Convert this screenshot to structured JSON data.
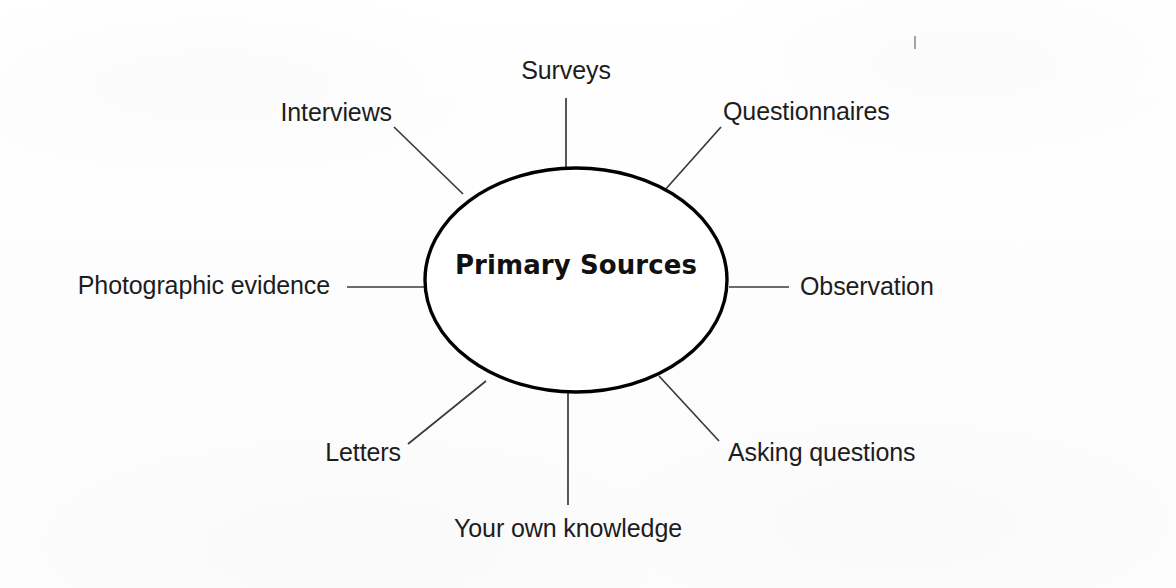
{
  "diagram": {
    "kind": "spider-diagram",
    "center_node": {
      "label": "Primary Sources",
      "shape": "ellipse",
      "cx": 576,
      "cy": 280,
      "rx": 151,
      "ry": 112,
      "stroke_color": "#000000",
      "stroke_width": 3.4,
      "fill_color": "#ffffff"
    },
    "spoke_color": "#3a3a3a",
    "spoke_width": 1.7,
    "background_color": "#ffffff",
    "text_color": "#1d1d1d",
    "branches": [
      {
        "id": "surveys",
        "label": "Surveys",
        "label_x": 566,
        "label_y": 58,
        "align": "center",
        "line": {
          "x1": 566,
          "y1": 98,
          "x2": 566,
          "y2": 170
        }
      },
      {
        "id": "interviews",
        "label": "Interviews",
        "label_x": 392,
        "label_y": 100,
        "align": "right",
        "line": {
          "x1": 394,
          "y1": 127,
          "x2": 463,
          "y2": 194
        }
      },
      {
        "id": "questionnaires",
        "label": "Questionnaires",
        "label_x": 723,
        "label_y": 99,
        "align": "left",
        "line": {
          "x1": 721,
          "y1": 127,
          "x2": 664,
          "y2": 191
        }
      },
      {
        "id": "observation",
        "label": "Observation",
        "label_x": 800,
        "label_y": 274,
        "align": "left",
        "line": {
          "x1": 729,
          "y1": 287,
          "x2": 789,
          "y2": 287
        }
      },
      {
        "id": "asking-questions",
        "label": "Asking questions",
        "label_x": 728,
        "label_y": 440,
        "align": "left",
        "line": {
          "x1": 659,
          "y1": 376,
          "x2": 719,
          "y2": 441
        }
      },
      {
        "id": "your-own-knowledge",
        "label": "Your own knowledge",
        "label_x": 568,
        "label_y": 516,
        "align": "center",
        "line": {
          "x1": 568,
          "y1": 393,
          "x2": 568,
          "y2": 505
        }
      },
      {
        "id": "letters",
        "label": "Letters",
        "label_x": 401,
        "label_y": 440,
        "align": "right",
        "line": {
          "x1": 408,
          "y1": 444,
          "x2": 486,
          "y2": 381
        }
      },
      {
        "id": "photographic-evidence",
        "label": "Photographic evidence",
        "label_x": 330,
        "label_y": 273,
        "align": "right",
        "line": {
          "x1": 347,
          "y1": 287,
          "x2": 424,
          "y2": 287
        }
      }
    ]
  }
}
